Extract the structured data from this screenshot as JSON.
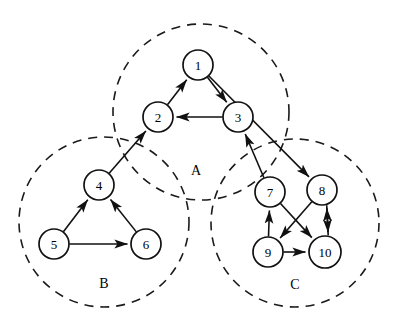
{
  "figure": {
    "background_color": "#ffffff",
    "stroke_color": "#111111",
    "width": 401,
    "height": 333
  },
  "clusters": [
    {
      "id": "A",
      "label": "A",
      "cx": 201,
      "cy": 112,
      "r": 88,
      "label_x": 196,
      "label_y": 170,
      "members": [
        "1",
        "2",
        "3"
      ]
    },
    {
      "id": "B",
      "label": "B",
      "cx": 104,
      "cy": 222,
      "r": 85,
      "label_x": 104,
      "label_y": 283,
      "members": [
        "4",
        "5",
        "6"
      ]
    },
    {
      "id": "C",
      "label": "C",
      "cx": 295,
      "cy": 223,
      "r": 84,
      "label_x": 295,
      "label_y": 284,
      "members": [
        "7",
        "8",
        "9",
        "10"
      ]
    }
  ],
  "nodes": [
    {
      "id": "1",
      "label": "1",
      "cx": 198,
      "cy": 65,
      "r": 15
    },
    {
      "id": "2",
      "label": "2",
      "cx": 158,
      "cy": 117,
      "r": 15
    },
    {
      "id": "3",
      "label": "3",
      "cx": 238,
      "cy": 117,
      "r": 15
    },
    {
      "id": "4",
      "label": "4",
      "cx": 99,
      "cy": 185,
      "r": 15
    },
    {
      "id": "5",
      "label": "5",
      "cx": 54,
      "cy": 244,
      "r": 15
    },
    {
      "id": "6",
      "label": "6",
      "cx": 146,
      "cy": 244,
      "r": 15
    },
    {
      "id": "7",
      "label": "7",
      "cx": 270,
      "cy": 192,
      "r": 15
    },
    {
      "id": "8",
      "label": "8",
      "cx": 322,
      "cy": 190,
      "r": 15
    },
    {
      "id": "9",
      "label": "9",
      "cx": 268,
      "cy": 252,
      "r": 15
    },
    {
      "id": "10",
      "label": "10",
      "cx": 325,
      "cy": 252,
      "r": 16
    }
  ],
  "edges": [
    {
      "from": "2",
      "to": "1",
      "directed": true,
      "offset": 0
    },
    {
      "from": "1",
      "to": "3",
      "directed": true,
      "offset": 0
    },
    {
      "from": "3",
      "to": "2",
      "directed": true,
      "offset": 0
    },
    {
      "from": "1",
      "to": "8",
      "directed": true,
      "offset": 0
    },
    {
      "from": "4",
      "to": "2",
      "directed": true,
      "offset": 0
    },
    {
      "from": "7",
      "to": "3",
      "directed": true,
      "offset": 0
    },
    {
      "from": "5",
      "to": "4",
      "directed": true,
      "offset": 0
    },
    {
      "from": "6",
      "to": "4",
      "directed": true,
      "offset": 0
    },
    {
      "from": "5",
      "to": "6",
      "directed": true,
      "offset": 0
    },
    {
      "from": "9",
      "to": "7",
      "directed": true,
      "offset": 0
    },
    {
      "from": "7",
      "to": "10",
      "directed": true,
      "offset": 0
    },
    {
      "from": "8",
      "to": "9",
      "directed": true,
      "offset": 0
    },
    {
      "from": "9",
      "to": "10",
      "directed": true,
      "offset": 0
    },
    {
      "from": "8",
      "to": "10",
      "directed": true,
      "offset": -4
    },
    {
      "from": "10",
      "to": "8",
      "directed": true,
      "offset": 4
    }
  ]
}
